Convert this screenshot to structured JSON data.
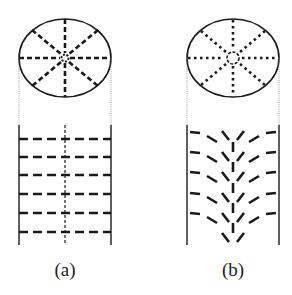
{
  "figure": {
    "panels": [
      {
        "id": "a",
        "label": "(a)",
        "description": "Top view circle with 8 dashed radial lines and small center ring; side view with parallel horizontal dashed lines and a dashed vertical center line",
        "ellipse": {
          "cx": 65,
          "cy": 58,
          "rx": 46,
          "ry": 39
        },
        "walls": {
          "left_x": 19,
          "right_x": 111,
          "top_y": 125,
          "bottom_y": 245
        },
        "rows_y": [
          139,
          157,
          175,
          194,
          213,
          232
        ]
      },
      {
        "id": "b",
        "label": "(b)",
        "description": "Top view circle with 8 dotted radial lines and a larger dashed center ring; side view with chevron-shaped dashed lines converging downward at center",
        "ellipse": {
          "cx": 233,
          "cy": 58,
          "rx": 46,
          "ry": 39
        },
        "walls": {
          "left_x": 187,
          "right_x": 279,
          "top_y": 125,
          "bottom_y": 245
        },
        "rows_y": [
          132,
          152,
          172,
          193,
          213,
          233
        ]
      }
    ],
    "colors": {
      "ink": "#1a1a1a",
      "guide": "#888888",
      "background": "#ffffff"
    }
  }
}
